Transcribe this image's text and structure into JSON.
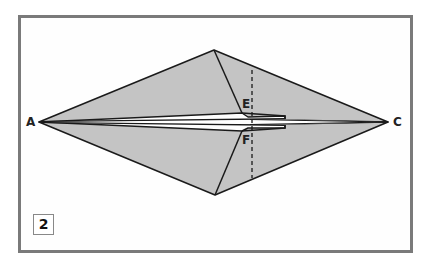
{
  "diagram": {
    "type": "origami-fold-step",
    "step_number": "2",
    "points": {
      "A": "A",
      "C": "C",
      "E": "E",
      "F": "F"
    },
    "colors": {
      "paper_fill": "#c4c4c4",
      "outline": "#1a1a1a",
      "frame_border": "#7a7a7a",
      "background": "#ffffff"
    },
    "fold_line": "dashed vertical valley fold through E and F"
  }
}
